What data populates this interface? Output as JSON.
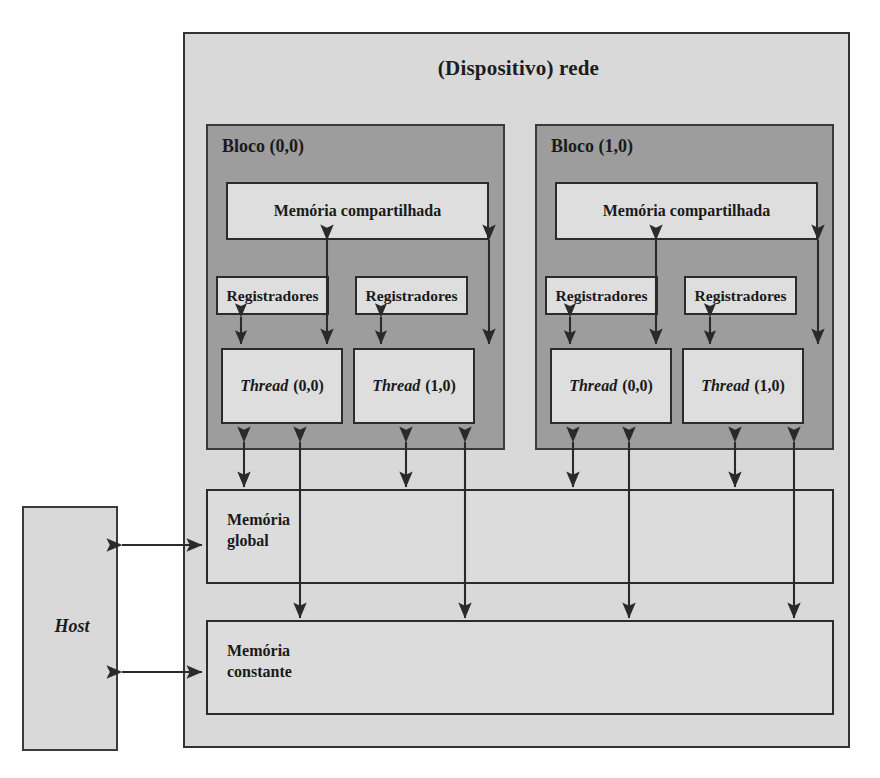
{
  "diagram": {
    "title": "(Dispositivo) rede",
    "host": {
      "label": "Host"
    },
    "blocks": [
      {
        "title": "Bloco (0,0)",
        "shared_memory": "Memória compartilhada",
        "registers": [
          "Registradores",
          "Registradores"
        ],
        "threads": [
          {
            "word": "Thread",
            "index": "(0,0)"
          },
          {
            "word": "Thread",
            "index": "(1,0)"
          }
        ]
      },
      {
        "title": "Bloco (1,0)",
        "shared_memory": "Memória compartilhada",
        "registers": [
          "Registradores",
          "Registradores"
        ],
        "threads": [
          {
            "word": "Thread",
            "index": "(0,0)"
          },
          {
            "word": "Thread",
            "index": "(1,0)"
          }
        ]
      }
    ],
    "memories": [
      {
        "name": "global-memory",
        "label": "Memória\nglobal"
      },
      {
        "name": "constant-memory",
        "label": "Memória\nconstante"
      }
    ],
    "colors": {
      "device_background": "#d9d9d9",
      "block_background": "#9d9d9d",
      "box_background": "#dedede",
      "border": "#2b2b2b",
      "arrow": "#2a2a2a",
      "text": "#1a1a1a",
      "page_background": "#ffffff"
    },
    "connections": {
      "host_to_global": "bidirectional",
      "host_to_constant": "bidirectional",
      "register_to_thread": "bidirectional",
      "thread_to_shared_memory": "bidirectional",
      "thread_to_global_memory": "bidirectional",
      "thread_to_constant_memory": "unidirectional-down"
    }
  }
}
